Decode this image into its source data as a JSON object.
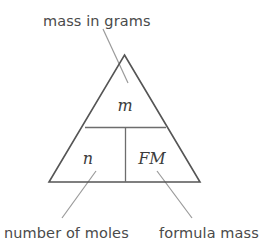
{
  "diagram": {
    "type": "formula-triangle",
    "background_color": "#ffffff",
    "outline_color": "#555555",
    "divider_color": "#6d6d6d",
    "leader_color": "#9a9a9a",
    "text_color": "#4a4a4a",
    "symbol_color": "#3c3c3c",
    "cells": {
      "top": {
        "symbol": "m",
        "label": "mass in grams"
      },
      "bottom_left": {
        "symbol": "n",
        "label": "number of moles"
      },
      "bottom_right": {
        "symbol": "FM",
        "label": "formula mass"
      }
    },
    "labels": {
      "top": "mass in grams",
      "bottom_left": "number of moles",
      "bottom_right": "formula mass"
    }
  }
}
